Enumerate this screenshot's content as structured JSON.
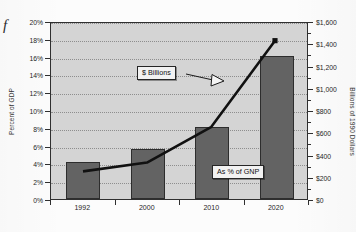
{
  "figure": {
    "marker": "f"
  },
  "chart_data": {
    "type": "bar",
    "title": "",
    "subtitle": "",
    "categories": [
      "1992",
      "2000",
      "2010",
      "2020"
    ],
    "xlabel": "",
    "ylabel": "Percent of GDP",
    "y2label": "Billions of 1990 Dollars",
    "ylim": [
      0,
      20
    ],
    "y2lim": [
      0,
      1600
    ],
    "grid": true,
    "legend_position": "none",
    "y_ticks": [
      "0%",
      "2%",
      "4%",
      "6%",
      "8%",
      "10%",
      "12%",
      "14%",
      "16%",
      "18%",
      "20%"
    ],
    "y_tick_values": [
      0,
      2,
      4,
      6,
      8,
      10,
      12,
      14,
      16,
      18,
      20
    ],
    "y2_ticks": [
      "$0",
      "$200",
      "$400",
      "$600",
      "$800",
      "$1,000",
      "$1,200",
      "$1,400",
      "$1,600"
    ],
    "y2_tick_values": [
      0,
      200,
      400,
      600,
      800,
      1000,
      1200,
      1400,
      1600
    ],
    "series": [
      {
        "name": "$ Billions",
        "type": "bar",
        "axis": "right",
        "color": "#636363",
        "values": [
          330,
          450,
          650,
          1290
        ]
      },
      {
        "name": "As % of GNP",
        "type": "line",
        "axis": "left",
        "color": "#111111",
        "values": [
          3.2,
          4.2,
          8.2,
          18.0
        ]
      }
    ],
    "annotations": [
      {
        "text": "$ Billions",
        "points_to": "bars"
      },
      {
        "text": "As % of GNP",
        "points_to": "line"
      }
    ]
  },
  "colors": {
    "plot_background": "#d4d4d4",
    "bar_fill": "#636363",
    "line": "#111111",
    "axis": "#2f2f2f",
    "gridline": "#8e8e8e"
  }
}
